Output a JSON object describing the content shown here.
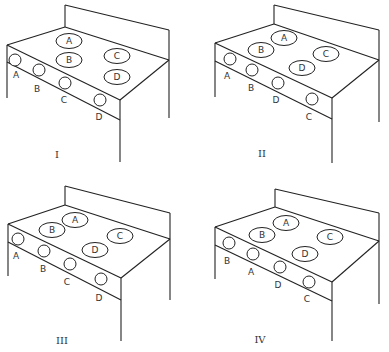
{
  "figure": {
    "line_color": "#222222",
    "background": "#ffffff"
  },
  "panels": [
    {
      "id": "I",
      "roman_label": "I",
      "origin": [
        0,
        0
      ],
      "burners": [
        {
          "label": "A",
          "cx": 69,
          "cy": 41
        },
        {
          "label": "B",
          "cx": 69,
          "cy": 60
        },
        {
          "label": "C",
          "cx": 117,
          "cy": 56
        },
        {
          "label": "D",
          "cx": 117,
          "cy": 77
        }
      ],
      "knobs": [
        {
          "label": "A",
          "cx": 15,
          "cy": 60,
          "lx": 16,
          "ly": 75
        },
        {
          "label": "B",
          "cx": 39,
          "cy": 70,
          "lx": 37,
          "ly": 89
        },
        {
          "label": "C",
          "cx": 65,
          "cy": 83,
          "lx": 64,
          "ly": 100
        },
        {
          "label": "D",
          "cx": 100,
          "cy": 100,
          "lx": 99,
          "ly": 117
        }
      ]
    },
    {
      "id": "II",
      "roman_label": "II",
      "origin": [
        195,
        0
      ],
      "burners": [
        {
          "label": "A",
          "cx": 89,
          "cy": 38
        },
        {
          "label": "B",
          "cx": 66,
          "cy": 50
        },
        {
          "label": "C",
          "cx": 131,
          "cy": 54
        },
        {
          "label": "D",
          "cx": 107,
          "cy": 68
        }
      ],
      "knobs": [
        {
          "label": "A",
          "cx": 35,
          "cy": 59,
          "lx": 32,
          "ly": 76
        },
        {
          "label": "B",
          "cx": 57,
          "cy": 70,
          "lx": 56,
          "ly": 88
        },
        {
          "label": "D",
          "cx": 83,
          "cy": 83,
          "lx": 81,
          "ly": 100
        },
        {
          "label": "C",
          "cx": 117,
          "cy": 99,
          "lx": 114,
          "ly": 117
        }
      ]
    },
    {
      "id": "III",
      "roman_label": "III",
      "origin": [
        0,
        176
      ],
      "burners": [
        {
          "label": "A",
          "cx": 75,
          "cy": 44
        },
        {
          "label": "B",
          "cx": 52,
          "cy": 54
        },
        {
          "label": "C",
          "cx": 120,
          "cy": 60
        },
        {
          "label": "D",
          "cx": 95,
          "cy": 74
        }
      ],
      "knobs": [
        {
          "label": "A",
          "cx": 18,
          "cy": 63,
          "lx": 16,
          "ly": 80
        },
        {
          "label": "B",
          "cx": 44,
          "cy": 75,
          "lx": 43,
          "ly": 93
        },
        {
          "label": "C",
          "cx": 70,
          "cy": 88,
          "lx": 67,
          "ly": 106
        },
        {
          "label": "D",
          "cx": 101,
          "cy": 103,
          "lx": 99,
          "ly": 122
        }
      ]
    },
    {
      "id": "IV",
      "roman_label": "IV",
      "origin": [
        195,
        176
      ],
      "burners": [
        {
          "label": "A",
          "cx": 91,
          "cy": 47
        },
        {
          "label": "B",
          "cx": 67,
          "cy": 59
        },
        {
          "label": "C",
          "cx": 135,
          "cy": 61
        },
        {
          "label": "D",
          "cx": 110,
          "cy": 78
        }
      ],
      "knobs": [
        {
          "label": "B",
          "cx": 34,
          "cy": 67,
          "lx": 32,
          "ly": 85
        },
        {
          "label": "A",
          "cx": 58,
          "cy": 78,
          "lx": 56,
          "ly": 96
        },
        {
          "label": "D",
          "cx": 85,
          "cy": 91,
          "lx": 83,
          "ly": 109
        },
        {
          "label": "C",
          "cx": 114,
          "cy": 106,
          "lx": 112,
          "ly": 123
        }
      ]
    }
  ],
  "geometry": {
    "I": {
      "bs_tl": [
        65,
        5
      ],
      "bs_tr": [
        169,
        30
      ],
      "top_l": [
        7,
        45
      ],
      "top_b": [
        65,
        27
      ],
      "top_r": [
        169,
        60
      ],
      "top_f": [
        120,
        100
      ],
      "pan_l": [
        7,
        62
      ],
      "pan_f": [
        120,
        120
      ],
      "leg_l": [
        7,
        98
      ],
      "leg_f": [
        120,
        162
      ],
      "leg_r": [
        169,
        118
      ],
      "roman": [
        57,
        155
      ]
    },
    "II": {
      "bs_tl": [
        79,
        5
      ],
      "bs_tr": [
        184,
        30
      ],
      "top_l": [
        20,
        43
      ],
      "top_b": [
        79,
        24
      ],
      "top_r": [
        184,
        60
      ],
      "top_f": [
        137,
        98
      ],
      "pan_l": [
        20,
        61
      ],
      "pan_f": [
        137,
        119
      ],
      "leg_l": [
        20,
        97
      ],
      "leg_f": [
        137,
        163
      ],
      "leg_r": [
        184,
        122
      ],
      "roman": [
        67,
        154
      ]
    },
    "III": {
      "bs_tl": [
        65,
        10
      ],
      "bs_tr": [
        170,
        37
      ],
      "top_l": [
        8,
        48
      ],
      "top_b": [
        65,
        29
      ],
      "top_r": [
        170,
        63
      ],
      "top_f": [
        121,
        102
      ],
      "pan_l": [
        8,
        66
      ],
      "pan_f": [
        121,
        124
      ],
      "leg_l": [
        8,
        100
      ],
      "leg_f": [
        121,
        165
      ],
      "leg_r": [
        170,
        124
      ],
      "roman": [
        62,
        165
      ]
    },
    "IV": {
      "bs_tl": [
        80,
        13
      ],
      "bs_tr": [
        184,
        37
      ],
      "top_l": [
        20,
        51
      ],
      "top_b": [
        80,
        31
      ],
      "top_r": [
        184,
        65
      ],
      "top_f": [
        137,
        106
      ],
      "pan_l": [
        20,
        69
      ],
      "pan_f": [
        137,
        125
      ],
      "leg_l": [
        20,
        103
      ],
      "leg_f": [
        137,
        165
      ],
      "leg_r": [
        184,
        128
      ],
      "roman": [
        65,
        164
      ]
    }
  }
}
